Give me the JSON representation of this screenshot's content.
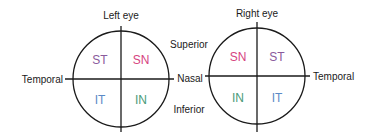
{
  "diagram": {
    "left_eye": {
      "title": "Left eye",
      "quadrants": {
        "top_left": {
          "label": "ST",
          "color": "#8a5a9c"
        },
        "top_right": {
          "label": "SN",
          "color": "#d6457f"
        },
        "bottom_left": {
          "label": "IT",
          "color": "#5a8ac6"
        },
        "bottom_right": {
          "label": "IN",
          "color": "#4a9a78"
        }
      },
      "outer_label": "Temporal"
    },
    "right_eye": {
      "title": "Right eye",
      "quadrants": {
        "top_left": {
          "label": "SN",
          "color": "#d6457f"
        },
        "top_right": {
          "label": "ST",
          "color": "#8a5a9c"
        },
        "bottom_left": {
          "label": "IN",
          "color": "#4a9a78"
        },
        "bottom_right": {
          "label": "IT",
          "color": "#5a8ac6"
        }
      },
      "outer_label": "Temporal"
    },
    "center_labels": {
      "superior": "Superior",
      "nasal": "Nasal",
      "inferior": "Inferior"
    }
  }
}
